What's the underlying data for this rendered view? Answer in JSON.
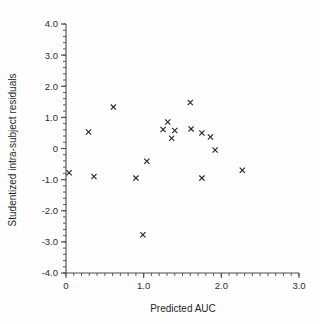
{
  "chart_data": {
    "type": "scatter",
    "title": "",
    "xlabel": "Predicted AUC",
    "ylabel": "Studentized intra-subject residuals",
    "xlim": [
      0,
      3.0
    ],
    "ylim": [
      -4.0,
      4.0
    ],
    "grid": false,
    "legend": null,
    "marker": "x",
    "marker_color": "#262626",
    "x_ticks": [
      0,
      1.0,
      2.0,
      3.0
    ],
    "x_tick_labels": [
      "0",
      "1.0",
      "2.0",
      "3.0"
    ],
    "x_minor_tick_step": 0.1,
    "y_ticks": [
      -4.0,
      -3.0,
      -2.0,
      -1.0,
      0,
      1.0,
      2.0,
      3.0,
      4.0
    ],
    "y_tick_labels": [
      "-4.0",
      "-3.0",
      "-2.0",
      "-1.0",
      "0",
      "1.0",
      "2.0",
      "3.0",
      "4.0"
    ],
    "y_minor_tick_step": 0.2,
    "points": [
      {
        "x": 0.04,
        "y": -0.78
      },
      {
        "x": 0.29,
        "y": 0.53
      },
      {
        "x": 0.36,
        "y": -0.9
      },
      {
        "x": 0.61,
        "y": 1.33
      },
      {
        "x": 0.9,
        "y": -0.95
      },
      {
        "x": 0.99,
        "y": -2.77
      },
      {
        "x": 1.04,
        "y": -0.41
      },
      {
        "x": 1.25,
        "y": 0.61
      },
      {
        "x": 1.31,
        "y": 0.85
      },
      {
        "x": 1.36,
        "y": 0.33
      },
      {
        "x": 1.4,
        "y": 0.58
      },
      {
        "x": 1.6,
        "y": 1.48
      },
      {
        "x": 1.61,
        "y": 0.63
      },
      {
        "x": 1.75,
        "y": 0.5
      },
      {
        "x": 1.75,
        "y": -0.95
      },
      {
        "x": 1.86,
        "y": 0.37
      },
      {
        "x": 1.92,
        "y": -0.05
      },
      {
        "x": 2.27,
        "y": -0.7
      }
    ]
  },
  "axes": {
    "x_title": "Predicted AUC",
    "y_title": "Studentized intra-subject residuals"
  }
}
